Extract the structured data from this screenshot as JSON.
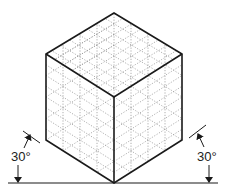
{
  "figure": {
    "colors": {
      "outline": "#1a1a1a",
      "grid": "#9a9a9a",
      "background": "#ffffff"
    },
    "cube": {
      "vertices": {
        "top": [
          114,
          13
        ],
        "upper_left": [
          46,
          54
        ],
        "upper_right": [
          182,
          54
        ],
        "center": [
          114,
          97
        ],
        "lower_left": [
          46,
          140
        ],
        "lower_right": [
          182,
          140
        ],
        "bottom": [
          114,
          183
        ]
      },
      "grid_divisions": 4
    },
    "ground_line": {
      "x1": 8,
      "x2": 218,
      "y": 183
    },
    "annotations": {
      "left_angle": {
        "label": "30°"
      },
      "right_angle": {
        "label": "30°"
      }
    }
  }
}
